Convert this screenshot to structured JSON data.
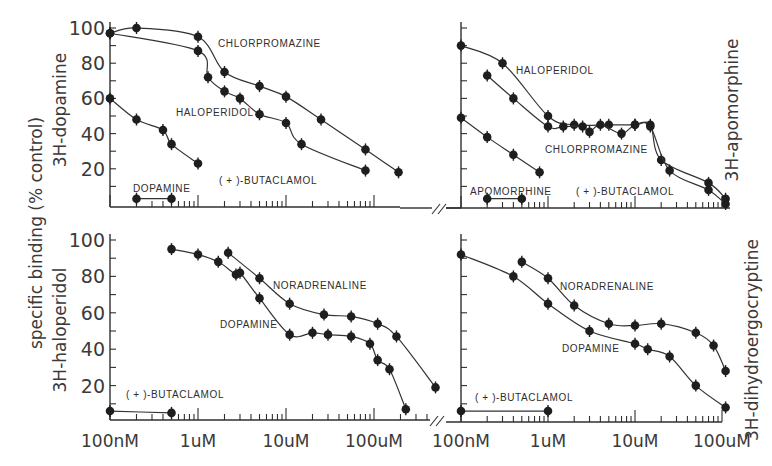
{
  "figure": {
    "y_axis_title": "specific binding (% control)",
    "x_tick_labels": [
      "100nM",
      "1uM",
      "10uM",
      "100uM"
    ],
    "y_tick_labels": [
      "100",
      "80",
      "60",
      "40",
      "20"
    ]
  },
  "chart_data": [
    {
      "type": "line",
      "panel": "top-left",
      "radioligand": "3H-dopamine",
      "ylabel": "3H-dopamine",
      "xlabel": "",
      "x_scale": "log",
      "x_ticks": [
        "100nM",
        "1uM",
        "10uM",
        "100uM"
      ],
      "ylim": [
        0,
        100
      ],
      "y_ticks": [
        20,
        40,
        60,
        80,
        100
      ],
      "series": [
        {
          "name": "CHLORPROMAZINE",
          "x_M": [
            1e-07,
            2e-07,
            1e-06,
            2e-06,
            5e-06,
            1e-05,
            2.5e-05,
            8e-05,
            0.00019
          ],
          "values": [
            97,
            100,
            95,
            75,
            67,
            61,
            48,
            31,
            18
          ]
        },
        {
          "name": "HALOPERIDOL",
          "x_M": [
            1e-07,
            1e-06,
            1.3e-06,
            2e-06,
            3e-06,
            5e-06,
            1e-05,
            1.5e-05,
            8e-05
          ],
          "values": [
            97,
            87,
            72,
            64,
            60,
            51,
            46,
            34,
            19
          ]
        },
        {
          "name": "(+)-BUTACLAMOL",
          "x_M": [
            1e-07,
            2e-07,
            4e-07,
            5e-07,
            1e-06
          ],
          "values": [
            60,
            48,
            42,
            34,
            23
          ]
        },
        {
          "name": "DOPAMINE",
          "x_M": [
            2e-07,
            5e-07
          ],
          "values": [
            3,
            3
          ]
        }
      ]
    },
    {
      "type": "line",
      "panel": "top-right",
      "radioligand": "3H-apomorphine",
      "ylabel": "3H-apomorphine",
      "xlabel": "",
      "x_scale": "log",
      "x_ticks": [
        "100nM",
        "1uM",
        "10uM",
        "100uM"
      ],
      "ylim": [
        0,
        100
      ],
      "y_ticks": [
        20,
        40,
        60,
        80,
        100
      ],
      "series": [
        {
          "name": "HALOPERIDOL",
          "x_M": [
            1e-07,
            3e-07,
            1e-06,
            2e-06,
            5e-06,
            1e-05,
            1.5e-05,
            2e-05,
            7e-05,
            0.00011
          ],
          "values": [
            90,
            80,
            50,
            45,
            45,
            45,
            45,
            25,
            12,
            3
          ]
        },
        {
          "name": "CHLORPROMAZINE",
          "x_M": [
            2e-07,
            4e-07,
            1e-06,
            1.5e-06,
            2.5e-06,
            3e-06,
            4e-06,
            7e-06,
            1e-05,
            1.5e-05,
            2.5e-05,
            7e-05,
            0.00011
          ],
          "values": [
            73,
            60,
            44,
            44,
            44,
            41,
            45,
            40,
            45,
            44,
            19,
            8,
            0
          ]
        },
        {
          "name": "(+)-BUTACLAMOL",
          "x_M": [
            1e-07,
            2e-07,
            4e-07,
            8e-07
          ],
          "values": [
            49,
            38,
            28,
            18
          ]
        },
        {
          "name": "APOMORPHINE",
          "x_M": [
            2e-07,
            5e-07
          ],
          "values": [
            3,
            3
          ]
        }
      ]
    },
    {
      "type": "line",
      "panel": "bottom-left",
      "radioligand": "3H-haloperidol",
      "ylabel": "3H-haloperidol",
      "xlabel": "",
      "x_scale": "log",
      "x_ticks": [
        "100nM",
        "1uM",
        "10uM",
        "100uM"
      ],
      "ylim": [
        0,
        100
      ],
      "y_ticks": [
        20,
        40,
        60,
        80,
        100
      ],
      "series": [
        {
          "name": "NORADRENALINE",
          "x_M": [
            2.2e-06,
            5e-06,
            1.1e-05,
            2.7e-05,
            5.5e-05,
            0.00011,
            0.00018,
            0.0005
          ],
          "values": [
            93,
            79,
            65,
            59,
            58,
            54,
            47,
            19
          ]
        },
        {
          "name": "DOPAMINE",
          "x_M": [
            5e-07,
            1e-06,
            1.7e-06,
            2.7e-06,
            3e-06,
            5e-06,
            1.1e-05,
            2e-05,
            3e-05,
            5.5e-05,
            9e-05,
            0.00011,
            0.00015,
            0.00023
          ],
          "values": [
            95,
            92,
            88,
            81,
            82,
            68,
            48,
            49,
            48,
            47,
            43,
            34,
            29,
            7
          ]
        },
        {
          "name": "(+)-BUTACLAMOL",
          "x_M": [
            1e-07,
            5e-07
          ],
          "values": [
            6,
            5
          ]
        }
      ]
    },
    {
      "type": "line",
      "panel": "bottom-right",
      "radioligand": "3H-dihydroergocryptine",
      "ylabel": "3H-dihydroergocryptine",
      "xlabel": "",
      "x_scale": "log",
      "x_ticks": [
        "100nM",
        "1uM",
        "10uM",
        "100uM"
      ],
      "ylim": [
        0,
        100
      ],
      "y_ticks": [
        20,
        40,
        60,
        80,
        100
      ],
      "series": [
        {
          "name": "NORADRENALINE",
          "x_M": [
            5e-07,
            1e-06,
            2e-06,
            5e-06,
            1e-05,
            2e-05,
            5e-05,
            8e-05,
            0.00011
          ],
          "values": [
            88,
            79,
            64,
            54,
            53,
            54,
            49,
            42,
            28
          ]
        },
        {
          "name": "DOPAMINE",
          "x_M": [
            1e-07,
            4e-07,
            1e-06,
            3e-06,
            1e-05,
            1.4e-05,
            2.5e-05,
            5e-05,
            0.00011
          ],
          "values": [
            92,
            80,
            65,
            50,
            43,
            40,
            36,
            20,
            8
          ]
        },
        {
          "name": "(+)-BUTACLAMOL",
          "x_M": [
            1e-07,
            1e-06
          ],
          "values": [
            6,
            6
          ]
        }
      ]
    }
  ]
}
